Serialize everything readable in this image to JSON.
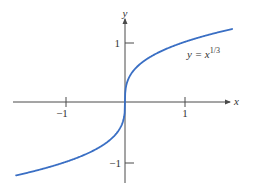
{
  "chart_data": {
    "type": "line",
    "title": "",
    "xlabel": "x",
    "ylabel": "y",
    "xlim": [
      -1.9,
      1.85
    ],
    "ylim": [
      -1.35,
      1.4
    ],
    "grid": false,
    "x_ticks": [
      -1,
      1
    ],
    "x_tick_labels": [
      "−1",
      "1"
    ],
    "y_ticks": [
      -1,
      1
    ],
    "y_tick_labels": [
      "−1",
      "1"
    ],
    "series": [
      {
        "name": "y = x^(1/3)",
        "function": "cbrt",
        "x_range": [
          -1.83,
          1.8
        ],
        "color": "#3a6fc4"
      }
    ],
    "annotations": [
      {
        "text": "y = x",
        "superscript": "1/3",
        "x": 1.25,
        "y": 0.95
      }
    ]
  },
  "colors": {
    "axis": "#4a4a4a",
    "curve": "#3a6fc4",
    "text": "#333333"
  }
}
